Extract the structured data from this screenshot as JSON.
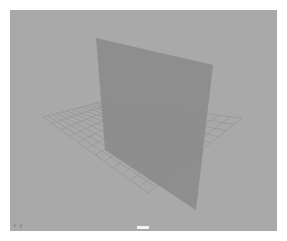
{
  "viewport": {
    "background": "#a9a9a9",
    "corner_label": "x y",
    "camera_label": "persp"
  },
  "scene": {
    "grid": {
      "color": "#909090",
      "corners": {
        "left": [
          33,
          107
        ],
        "back": [
          90,
          92
        ],
        "right": [
          232,
          108
        ],
        "front": [
          138,
          183
        ]
      },
      "divisions": 12
    },
    "plane": {
      "color": "#8a8a8a",
      "opacity": 0.85,
      "vertices": [
        [
          86,
          28
        ],
        [
          203,
          55
        ],
        [
          186,
          200
        ],
        [
          95,
          140
        ]
      ]
    }
  }
}
